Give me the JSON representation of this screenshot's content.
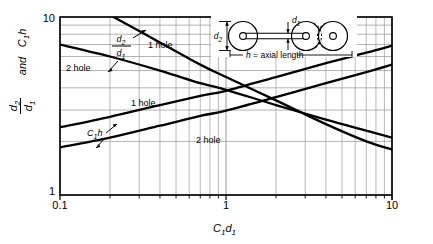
{
  "figure": {
    "background_color": "#ffffff",
    "line_color": "#000000",
    "grid_color": "#9a9a9a",
    "frame_color": "#000000"
  },
  "axes": {
    "x_title_main": "C",
    "x_title_sub1": "1",
    "x_title_main2": "d",
    "x_title_sub2": "1",
    "y_title_num_main": "d",
    "y_title_num_sub": "2",
    "y_title_den_main": "d",
    "y_title_den_sub": "1",
    "y_title_and": "and",
    "y_title_c_main": "C",
    "y_title_c_sub": "1",
    "y_title_h": "h",
    "x_ticks": [
      "0.1",
      "1",
      "10"
    ],
    "y_ticks": [
      "1",
      "10"
    ]
  },
  "curve_labels": {
    "two_hole_upper": "2 hole",
    "one_hole_upper": "1 hole",
    "one_hole_middle": "1 hole",
    "two_hole_lower": "2 hole",
    "ratio_numerator": "d",
    "ratio_numerator_sub": "2",
    "ratio_denominator": "d",
    "ratio_denominator_sub": "1",
    "c1h_main": "C",
    "c1h_sub": "1",
    "c1h_h": "h"
  },
  "inset": {
    "label_d1_main": "d",
    "label_d1_sub": "1",
    "label_d2_main": "d",
    "label_d2_sub": "2",
    "caption_h": "h",
    "caption_rest": " = axial length"
  },
  "chart_data": {
    "type": "line",
    "title": "",
    "xlabel": "C1 d1",
    "ylabel": "d2/d1 and C1 h",
    "xscale": "log",
    "yscale": "log",
    "xlim": [
      0.1,
      10
    ],
    "ylim": [
      1,
      10
    ],
    "grid": true,
    "legend": "inline-annotations",
    "series": [
      {
        "name": "d2/d1 - 2 hole",
        "label": "2 hole",
        "direction": "decreasing",
        "x": [
          0.1,
          0.2,
          0.4,
          0.7,
          1.0,
          2.0,
          4.0,
          7.0,
          10.0
        ],
        "y": [
          7.0,
          6.0,
          5.0,
          4.25,
          3.9,
          3.2,
          2.65,
          2.3,
          2.1
        ]
      },
      {
        "name": "d2/d1 - 1 hole",
        "label": "1 hole",
        "direction": "decreasing",
        "x": [
          0.21,
          0.4,
          0.7,
          1.0,
          2.0,
          4.0,
          7.0,
          10.0
        ],
        "y": [
          10.0,
          7.2,
          5.4,
          4.6,
          3.4,
          2.5,
          2.0,
          1.8
        ]
      },
      {
        "name": "C1h - 1 hole",
        "label": "1 hole",
        "direction": "increasing",
        "x": [
          0.1,
          0.2,
          0.4,
          0.7,
          1.0,
          2.0,
          4.0,
          7.0,
          10.0
        ],
        "y": [
          2.4,
          2.75,
          3.2,
          3.6,
          3.85,
          4.6,
          5.5,
          6.3,
          6.9
        ]
      },
      {
        "name": "C1h - 2 hole",
        "label": "2 hole",
        "direction": "increasing",
        "x": [
          0.1,
          0.2,
          0.4,
          0.7,
          1.0,
          2.0,
          4.0,
          7.0,
          10.0
        ],
        "y": [
          1.85,
          2.1,
          2.45,
          2.78,
          2.98,
          3.55,
          4.25,
          4.9,
          5.4
        ]
      }
    ]
  }
}
